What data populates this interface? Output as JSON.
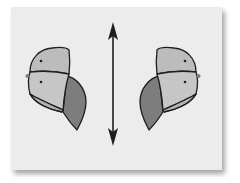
{
  "diagram": {
    "type": "mirror-symmetry",
    "elements": [
      {
        "name": "left-shape",
        "description": "rounded head-like shape with two dots, dark lobe on right side"
      },
      {
        "name": "mirror-arrow",
        "description": "vertical double-headed arrow (line of reflection)"
      },
      {
        "name": "right-shape",
        "description": "mirror image of left shape, dark lobe on left side"
      }
    ],
    "colors": {
      "background": "#ffffff",
      "card": "#ececec",
      "light_fill": "#b9b9b9",
      "mid_fill": "#c4c4c4",
      "dark_fill": "#7d7d7d",
      "outline": "#1e1e1e"
    }
  }
}
